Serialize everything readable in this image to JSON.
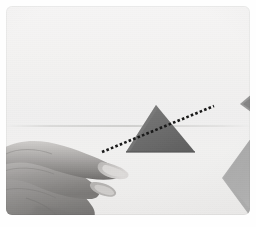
{
  "photo": {
    "title": "Hand indicating a dark triangle with a dotted trajectory line",
    "alt_text": "A pale hand with fingers extended from the left points toward a dark gray triangle resting on a white sheet of paper; a hand-drawn dotted line runs diagonally from the fingertips up through the triangle toward the upper right.",
    "medium": "photograph",
    "orientation": "landscape",
    "border_color": "#fefefe",
    "corner_radius_px": 6
  },
  "scene": {
    "background": {
      "name": "white paper sheet",
      "color": "#f1f0ee",
      "highlight_color": "#f4f3f1",
      "shadow_color": "#e6e4e1",
      "seam_label": "paper sheet edge"
    },
    "subjects": [
      {
        "name": "hand",
        "description": "left hand, fingers extended horizontally, pointing to the right toward the triangle",
        "skin_light": "#cfc8c2",
        "skin_mid": "#a69f99",
        "skin_shadow": "#7c7670",
        "nail_color": "#ded7d1",
        "position": "lower left"
      },
      {
        "name": "dark triangle",
        "description": "dark gray isoceles triangle sitting on the paper, apex up",
        "color": "#6f6f6f",
        "shade_color": "#5e5e5e",
        "position": "center"
      },
      {
        "name": "light triangle",
        "description": "light gray wedge partly cropped by the frame",
        "color": "#a9a9a9",
        "position": "bottom right corner"
      },
      {
        "name": "small dark triangle",
        "description": "small dark gray triangle fragment cropped by the right frame edge",
        "color": "#8d8d8d",
        "position": "right edge"
      },
      {
        "name": "dotted line",
        "description": "hand-drawn dotted line crossing the triangle from lower left to upper right",
        "color": "#1b1b1b",
        "dot_count": 32,
        "start_point": "fingertips, lower left",
        "end_point": "upper right of triangle"
      }
    ]
  }
}
